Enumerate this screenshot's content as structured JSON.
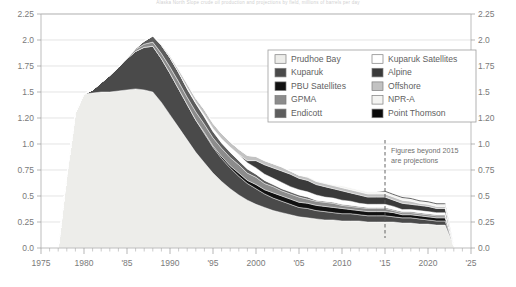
{
  "chart_data": {
    "type": "area",
    "stacked": true,
    "title": "Alaska North Slope crude oil production and projections by field, millions of barrels per day",
    "xlabel": "",
    "ylabel": "",
    "xlim": [
      1975,
      2025
    ],
    "ylim": [
      0,
      2.25
    ],
    "grid": true,
    "legend_position": "top-right-inside",
    "x_ticks": [
      {
        "value": 1975,
        "label": "1975"
      },
      {
        "value": 1980,
        "label": "1980"
      },
      {
        "value": 1985,
        "label": "'85"
      },
      {
        "value": 1990,
        "label": "1990"
      },
      {
        "value": 1995,
        "label": "'95"
      },
      {
        "value": 2000,
        "label": "2000"
      },
      {
        "value": 2005,
        "label": "'05"
      },
      {
        "value": 2010,
        "label": "2010"
      },
      {
        "value": 2015,
        "label": "'15"
      },
      {
        "value": 2020,
        "label": "2020"
      },
      {
        "value": 2025,
        "label": "'25"
      }
    ],
    "y_ticks": [
      {
        "value": 0.0,
        "label": "0.0"
      },
      {
        "value": 0.25,
        "label": "0.25"
      },
      {
        "value": 0.5,
        "label": "0.5"
      },
      {
        "value": 0.75,
        "label": "0.75"
      },
      {
        "value": 1.0,
        "label": "1.0"
      },
      {
        "value": 1.25,
        "label": "1.20"
      },
      {
        "value": 1.5,
        "label": "1.5"
      },
      {
        "value": 1.75,
        "label": "1.75"
      },
      {
        "value": 2.0,
        "label": "2.0"
      },
      {
        "value": 2.25,
        "label": "2.25"
      }
    ],
    "y_gridlines": [
      0.25,
      0.5,
      0.75,
      1.0,
      1.25,
      1.5,
      1.75,
      2.0,
      2.25
    ],
    "annotation": {
      "text_line1": "Figures beyond 2015",
      "text_line2": "are projections",
      "divider_x": 2015
    },
    "x": [
      1977,
      1978,
      1979,
      1980,
      1981,
      1982,
      1983,
      1984,
      1985,
      1986,
      1987,
      1988,
      1989,
      1990,
      1991,
      1992,
      1993,
      1994,
      1995,
      1996,
      1997,
      1998,
      1999,
      2000,
      2001,
      2002,
      2003,
      2004,
      2005,
      2006,
      2007,
      2008,
      2009,
      2010,
      2011,
      2012,
      2013,
      2014,
      2015,
      2016,
      2017,
      2018,
      2019,
      2020,
      2021,
      2022,
      2023
    ],
    "series": [
      {
        "name": "Prudhoe Bay",
        "color": "#ededea",
        "values": [
          0.0,
          0.7,
          1.3,
          1.48,
          1.49,
          1.5,
          1.5,
          1.51,
          1.52,
          1.53,
          1.52,
          1.5,
          1.4,
          1.28,
          1.16,
          1.04,
          0.92,
          0.82,
          0.72,
          0.64,
          0.57,
          0.51,
          0.46,
          0.42,
          0.39,
          0.36,
          0.34,
          0.32,
          0.3,
          0.29,
          0.28,
          0.27,
          0.27,
          0.26,
          0.26,
          0.26,
          0.25,
          0.25,
          0.25,
          0.25,
          0.24,
          0.24,
          0.23,
          0.23,
          0.22,
          0.22,
          0.02
        ]
      },
      {
        "name": "Kuparuk",
        "color": "#4a4a4a",
        "values": [
          0.0,
          0.0,
          0.0,
          0.0,
          0.03,
          0.09,
          0.16,
          0.23,
          0.3,
          0.36,
          0.41,
          0.44,
          0.42,
          0.4,
          0.37,
          0.34,
          0.31,
          0.28,
          0.25,
          0.22,
          0.2,
          0.18,
          0.16,
          0.15,
          0.13,
          0.12,
          0.11,
          0.1,
          0.09,
          0.09,
          0.08,
          0.08,
          0.07,
          0.07,
          0.07,
          0.06,
          0.06,
          0.06,
          0.06,
          0.05,
          0.05,
          0.05,
          0.05,
          0.04,
          0.04,
          0.04,
          0.0
        ]
      },
      {
        "name": "PBU Satellites",
        "color": "#111111",
        "values": [
          0.0,
          0.0,
          0.0,
          0.0,
          0.0,
          0.0,
          0.0,
          0.0,
          0.0,
          0.0,
          0.0,
          0.0,
          0.0,
          0.0,
          0.0,
          0.0,
          0.0,
          0.01,
          0.01,
          0.02,
          0.02,
          0.03,
          0.03,
          0.04,
          0.04,
          0.05,
          0.05,
          0.05,
          0.05,
          0.05,
          0.05,
          0.05,
          0.05,
          0.05,
          0.04,
          0.04,
          0.04,
          0.04,
          0.04,
          0.04,
          0.03,
          0.03,
          0.03,
          0.03,
          0.03,
          0.03,
          0.0
        ]
      },
      {
        "name": "GPMA",
        "color": "#8c8c8c",
        "values": [
          0.0,
          0.0,
          0.0,
          0.0,
          0.0,
          0.0,
          0.0,
          0.0,
          0.01,
          0.02,
          0.03,
          0.04,
          0.05,
          0.06,
          0.07,
          0.07,
          0.08,
          0.08,
          0.08,
          0.08,
          0.08,
          0.08,
          0.07,
          0.07,
          0.06,
          0.06,
          0.05,
          0.05,
          0.05,
          0.04,
          0.04,
          0.04,
          0.04,
          0.03,
          0.03,
          0.03,
          0.03,
          0.03,
          0.03,
          0.02,
          0.02,
          0.02,
          0.02,
          0.02,
          0.02,
          0.02,
          0.0
        ]
      },
      {
        "name": "Endicott",
        "color": "#5d5d5d",
        "values": [
          0.0,
          0.0,
          0.0,
          0.0,
          0.0,
          0.0,
          0.0,
          0.0,
          0.0,
          0.01,
          0.03,
          0.06,
          0.08,
          0.09,
          0.09,
          0.08,
          0.08,
          0.07,
          0.06,
          0.05,
          0.05,
          0.04,
          0.04,
          0.03,
          0.03,
          0.02,
          0.02,
          0.02,
          0.02,
          0.02,
          0.01,
          0.01,
          0.01,
          0.01,
          0.01,
          0.01,
          0.01,
          0.01,
          0.01,
          0.01,
          0.01,
          0.01,
          0.01,
          0.01,
          0.01,
          0.01,
          0.0
        ]
      },
      {
        "name": "Kuparuk Satellites",
        "color": "#ffffff",
        "values": [
          0.0,
          0.0,
          0.0,
          0.0,
          0.0,
          0.0,
          0.0,
          0.0,
          0.0,
          0.0,
          0.0,
          0.0,
          0.0,
          0.0,
          0.0,
          0.01,
          0.01,
          0.02,
          0.03,
          0.04,
          0.05,
          0.06,
          0.06,
          0.06,
          0.06,
          0.06,
          0.06,
          0.05,
          0.05,
          0.05,
          0.05,
          0.04,
          0.04,
          0.04,
          0.04,
          0.03,
          0.03,
          0.03,
          0.03,
          0.03,
          0.02,
          0.02,
          0.02,
          0.02,
          0.02,
          0.02,
          0.0
        ]
      },
      {
        "name": "Alpine",
        "color": "#3a3a3a",
        "values": [
          0.0,
          0.0,
          0.0,
          0.0,
          0.0,
          0.0,
          0.0,
          0.0,
          0.0,
          0.0,
          0.0,
          0.0,
          0.0,
          0.0,
          0.0,
          0.0,
          0.0,
          0.0,
          0.0,
          0.0,
          0.0,
          0.0,
          0.02,
          0.07,
          0.09,
          0.1,
          0.11,
          0.12,
          0.11,
          0.11,
          0.1,
          0.1,
          0.09,
          0.09,
          0.08,
          0.08,
          0.07,
          0.07,
          0.07,
          0.06,
          0.06,
          0.05,
          0.05,
          0.05,
          0.04,
          0.04,
          0.0
        ]
      },
      {
        "name": "Offshore",
        "color": "#c2c2c2",
        "values": [
          0.0,
          0.0,
          0.0,
          0.0,
          0.0,
          0.0,
          0.0,
          0.0,
          0.0,
          0.0,
          0.0,
          0.0,
          0.01,
          0.02,
          0.03,
          0.04,
          0.04,
          0.05,
          0.05,
          0.05,
          0.05,
          0.05,
          0.05,
          0.04,
          0.04,
          0.04,
          0.04,
          0.03,
          0.03,
          0.03,
          0.03,
          0.03,
          0.03,
          0.03,
          0.03,
          0.03,
          0.03,
          0.03,
          0.03,
          0.03,
          0.03,
          0.03,
          0.02,
          0.02,
          0.02,
          0.02,
          0.0
        ]
      },
      {
        "name": "NPR-A",
        "color": "#f4f4f2",
        "values": [
          0.0,
          0.0,
          0.0,
          0.0,
          0.0,
          0.0,
          0.0,
          0.0,
          0.0,
          0.0,
          0.0,
          0.0,
          0.0,
          0.0,
          0.0,
          0.0,
          0.0,
          0.0,
          0.0,
          0.0,
          0.0,
          0.0,
          0.0,
          0.0,
          0.0,
          0.0,
          0.0,
          0.0,
          0.0,
          0.01,
          0.01,
          0.01,
          0.01,
          0.02,
          0.02,
          0.02,
          0.02,
          0.02,
          0.02,
          0.02,
          0.02,
          0.02,
          0.02,
          0.02,
          0.02,
          0.02,
          0.0
        ]
      },
      {
        "name": "Point Thomson",
        "color": "#0a0a0a",
        "values": [
          0.0,
          0.0,
          0.0,
          0.0,
          0.0,
          0.0,
          0.0,
          0.0,
          0.0,
          0.0,
          0.0,
          0.0,
          0.0,
          0.0,
          0.0,
          0.0,
          0.0,
          0.0,
          0.0,
          0.0,
          0.0,
          0.0,
          0.0,
          0.0,
          0.0,
          0.0,
          0.0,
          0.0,
          0.0,
          0.0,
          0.0,
          0.0,
          0.0,
          0.0,
          0.0,
          0.0,
          0.0,
          0.0,
          0.01,
          0.01,
          0.01,
          0.01,
          0.01,
          0.01,
          0.01,
          0.01,
          0.0
        ]
      }
    ],
    "legend": [
      {
        "label": "Prudhoe Bay",
        "color": "#ededea",
        "column": 0,
        "row": 0
      },
      {
        "label": "Kuparuk",
        "color": "#4a4a4a",
        "column": 0,
        "row": 1
      },
      {
        "label": "PBU Satellites",
        "color": "#111111",
        "column": 0,
        "row": 2
      },
      {
        "label": "GPMA",
        "color": "#8c8c8c",
        "column": 0,
        "row": 3
      },
      {
        "label": "Endicott",
        "color": "#5d5d5d",
        "column": 0,
        "row": 4
      },
      {
        "label": "Kuparuk Satellites",
        "color": "#ffffff",
        "column": 1,
        "row": 0
      },
      {
        "label": "Alpine",
        "color": "#3a3a3a",
        "column": 1,
        "row": 1
      },
      {
        "label": "Offshore",
        "color": "#c2c2c2",
        "column": 1,
        "row": 2
      },
      {
        "label": "NPR-A",
        "color": "#f4f4f2",
        "column": 1,
        "row": 3
      },
      {
        "label": "Point Thomson",
        "color": "#0a0a0a",
        "column": 1,
        "row": 4
      }
    ]
  }
}
